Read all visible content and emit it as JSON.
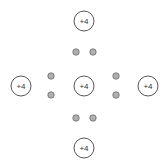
{
  "diagram": {
    "colors": {
      "nucleus_stroke": "#444444",
      "nucleus_fill": "#ffffff",
      "electron_fill": "#b0b0b0",
      "electron_stroke": "#6a6a6a",
      "label": "#333333"
    },
    "nuclei": [
      {
        "id": "top",
        "label": "+4",
        "cx": 84,
        "cy": 21
      },
      {
        "id": "left",
        "label": "+4",
        "cx": 21,
        "cy": 86
      },
      {
        "id": "center",
        "label": "+4",
        "cx": 84,
        "cy": 86
      },
      {
        "id": "right",
        "label": "+4",
        "cx": 148,
        "cy": 86
      },
      {
        "id": "bottom",
        "label": "+4",
        "cx": 84,
        "cy": 148
      }
    ],
    "electrons": [
      {
        "id": "top-a",
        "cx": 76,
        "cy": 52
      },
      {
        "id": "top-b",
        "cx": 93,
        "cy": 52
      },
      {
        "id": "left-a",
        "cx": 51,
        "cy": 76
      },
      {
        "id": "left-b",
        "cx": 51,
        "cy": 95
      },
      {
        "id": "right-a",
        "cx": 116,
        "cy": 76
      },
      {
        "id": "right-b",
        "cx": 116,
        "cy": 95
      },
      {
        "id": "bottom-a",
        "cx": 76,
        "cy": 118
      },
      {
        "id": "bottom-b",
        "cx": 93,
        "cy": 118
      }
    ]
  }
}
